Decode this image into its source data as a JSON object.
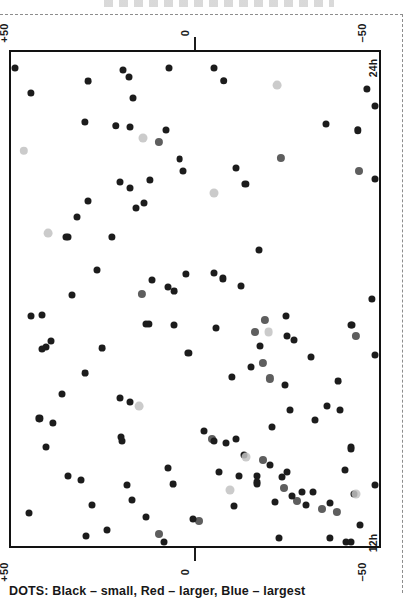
{
  "figure": {
    "caption": "DOTS: Black – small, Red – larger, Blue – largest",
    "axis_labels": {
      "top_left": "+50",
      "top_zero": "0",
      "top_right": "–50",
      "bottom_left": "+50",
      "bottom_zero": "0",
      "bottom_right": "–50",
      "right_upper": "24h",
      "right_lower": "12h"
    }
  },
  "chart_data": {
    "type": "scatter",
    "title": "",
    "subtitle": "",
    "caption": "DOTS: Black – small, Red – larger, Blue – largest",
    "xlabel": "",
    "ylabel": "",
    "xlim": [
      50,
      -50
    ],
    "ylim": [
      12,
      24
    ],
    "xticks": [
      50,
      0,
      -50
    ],
    "xticklabels": [
      "+50",
      "0",
      "–50"
    ],
    "yticks": [
      24,
      12
    ],
    "yticklabels": [
      "24h",
      "12h"
    ],
    "grid": false,
    "legend_position": "below-axes",
    "legend": [
      {
        "name": "Black",
        "size": "small",
        "color": "#1c1c1c",
        "radius_px": 3.6
      },
      {
        "name": "Red",
        "size": "larger",
        "color": "#5a5a5a",
        "radius_px": 4.2
      },
      {
        "name": "Blue",
        "size": "largest",
        "color": "#b9b9b9",
        "radius_px": 4.6
      }
    ],
    "note": "Scanned monochrome reproduction: colour classes appear as differing grey levels.",
    "point_count": 150,
    "points": [
      {
        "x": 44.5,
        "y": 23.0,
        "c": "black",
        "r": 3.6
      },
      {
        "x": 29.1,
        "y": 23.3,
        "c": "black",
        "r": 3.4
      },
      {
        "x": 17.9,
        "y": 23.4,
        "c": "black",
        "r": 3.5
      },
      {
        "x": -7.8,
        "y": 23.3,
        "c": "black",
        "r": 3.8
      },
      {
        "x": -22.3,
        "y": 23.2,
        "c": "blue",
        "r": 4.4
      },
      {
        "x": -46.7,
        "y": 23.1,
        "c": "black",
        "r": 3.6
      },
      {
        "x": 29.9,
        "y": 22.3,
        "c": "black",
        "r": 3.6
      },
      {
        "x": 21.5,
        "y": 22.2,
        "c": "black",
        "r": 3.7
      },
      {
        "x": 8.0,
        "y": 22.1,
        "c": "black",
        "r": 3.5
      },
      {
        "x": -44.2,
        "y": 22.1,
        "c": "black",
        "r": 3.7
      },
      {
        "x": 46.5,
        "y": 21.6,
        "c": "blue",
        "r": 4.2
      },
      {
        "x": 4.2,
        "y": 21.4,
        "c": "black",
        "r": 3.4
      },
      {
        "x": 3.2,
        "y": 21.1,
        "c": "black",
        "r": 3.5
      },
      {
        "x": -44.5,
        "y": 21.1,
        "c": "red",
        "r": 4.0
      },
      {
        "x": 12.2,
        "y": 20.9,
        "c": "black",
        "r": 3.6
      },
      {
        "x": -13.7,
        "y": 20.8,
        "c": "black",
        "r": 3.6
      },
      {
        "x": 16.0,
        "y": 20.2,
        "c": "black",
        "r": 3.5
      },
      {
        "x": 40.0,
        "y": 19.6,
        "c": "blue",
        "r": 4.4
      },
      {
        "x": 22.5,
        "y": 19.5,
        "c": "black",
        "r": 3.6
      },
      {
        "x": -17.5,
        "y": 19.2,
        "c": "black",
        "r": 3.5
      },
      {
        "x": 26.6,
        "y": 18.7,
        "c": "black",
        "r": 3.5
      },
      {
        "x": 2.5,
        "y": 18.6,
        "c": "black",
        "r": 3.6
      },
      {
        "x": -7.6,
        "y": 18.5,
        "c": "black",
        "r": 3.6
      },
      {
        "x": 33.5,
        "y": 18.1,
        "c": "black",
        "r": 3.5
      },
      {
        "x": 7.3,
        "y": 18.3,
        "c": "black",
        "r": 3.5
      },
      {
        "x": 5.7,
        "y": 18.2,
        "c": "black",
        "r": 3.4
      },
      {
        "x": -48.0,
        "y": 18.0,
        "c": "black",
        "r": 3.6
      },
      {
        "x": 41.5,
        "y": 17.6,
        "c": "black",
        "r": 3.5
      },
      {
        "x": 12.5,
        "y": 17.4,
        "c": "black",
        "r": 3.6
      },
      {
        "x": -5.6,
        "y": 17.3,
        "c": "black",
        "r": 3.5
      },
      {
        "x": -16.4,
        "y": 17.2,
        "c": "red",
        "r": 4.0
      },
      {
        "x": -20.0,
        "y": 17.2,
        "c": "blue",
        "r": 4.4
      },
      {
        "x": -25.0,
        "y": 17.1,
        "c": "black",
        "r": 3.5
      },
      {
        "x": -27.0,
        "y": 17.0,
        "c": "black",
        "r": 3.5
      },
      {
        "x": 25.3,
        "y": 16.8,
        "c": "black",
        "r": 3.4
      },
      {
        "x": 1.8,
        "y": 16.7,
        "c": "black",
        "r": 3.6
      },
      {
        "x": -31.4,
        "y": 16.6,
        "c": "black",
        "r": 3.5
      },
      {
        "x": 29.8,
        "y": 16.2,
        "c": "black",
        "r": 3.4
      },
      {
        "x": -10.0,
        "y": 16.1,
        "c": "black",
        "r": 3.6
      },
      {
        "x": -38.9,
        "y": 16.0,
        "c": "black",
        "r": 3.4
      },
      {
        "x": 36.2,
        "y": 15.7,
        "c": "black",
        "r": 3.5
      },
      {
        "x": 20.4,
        "y": 15.6,
        "c": "black",
        "r": 3.5
      },
      {
        "x": 17.8,
        "y": 15.5,
        "c": "black",
        "r": 3.5
      },
      {
        "x": 15.1,
        "y": 15.4,
        "c": "blue",
        "r": 4.4
      },
      {
        "x": -36.0,
        "y": 15.4,
        "c": "black",
        "r": 3.5
      },
      {
        "x": -39.5,
        "y": 15.3,
        "c": "black",
        "r": 3.5
      },
      {
        "x": 42.3,
        "y": 15.1,
        "c": "black",
        "r": 3.6
      },
      {
        "x": 38.6,
        "y": 15.0,
        "c": "black",
        "r": 3.6
      },
      {
        "x": -21.0,
        "y": 14.9,
        "c": "black",
        "r": 3.5
      },
      {
        "x": -2.5,
        "y": 14.8,
        "c": "black",
        "r": 3.5
      },
      {
        "x": -4.5,
        "y": 14.6,
        "c": "red",
        "r": 4.0
      },
      {
        "x": -8.4,
        "y": 14.5,
        "c": "black",
        "r": 3.5
      },
      {
        "x": -42.4,
        "y": 14.4,
        "c": "black",
        "r": 3.5
      },
      {
        "x": -13.3,
        "y": 14.2,
        "c": "black",
        "r": 3.5
      },
      {
        "x": -18.5,
        "y": 14.1,
        "c": "red",
        "r": 4.0
      },
      {
        "x": -6.5,
        "y": 13.8,
        "c": "black",
        "r": 3.5
      },
      {
        "x": -12.0,
        "y": 13.7,
        "c": "black",
        "r": 3.5
      },
      {
        "x": 31.0,
        "y": 13.6,
        "c": "black",
        "r": 3.5
      },
      {
        "x": 6.0,
        "y": 13.5,
        "c": "black",
        "r": 3.4
      },
      {
        "x": -16.8,
        "y": 13.5,
        "c": "black",
        "r": 3.5
      },
      {
        "x": -24.2,
        "y": 13.4,
        "c": "red",
        "r": 4.0
      },
      {
        "x": -29.0,
        "y": 13.3,
        "c": "black",
        "r": 3.5
      },
      {
        "x": -32.1,
        "y": 13.3,
        "c": "black",
        "r": 3.5
      },
      {
        "x": -27.6,
        "y": 13.1,
        "c": "red",
        "r": 4.0
      },
      {
        "x": -30.2,
        "y": 13.0,
        "c": "black",
        "r": 3.5
      },
      {
        "x": -34.6,
        "y": 12.9,
        "c": "red",
        "r": 4.0
      },
      {
        "x": 45.0,
        "y": 12.8,
        "c": "black",
        "r": 3.5
      },
      {
        "x": 13.4,
        "y": 12.7,
        "c": "black",
        "r": 3.5
      },
      {
        "x": -1.2,
        "y": 12.6,
        "c": "red",
        "r": 4.0
      },
      {
        "x": -44.8,
        "y": 12.5,
        "c": "black",
        "r": 3.5
      },
      {
        "x": 24.0,
        "y": 12.4,
        "c": "black",
        "r": 3.5
      },
      {
        "x": 9.8,
        "y": 12.3,
        "c": "red",
        "r": 4.0
      },
      {
        "x": -22.7,
        "y": 12.2,
        "c": "black",
        "r": 3.5
      },
      {
        "x": -36.7,
        "y": 12.2,
        "c": "black",
        "r": 3.6
      },
      {
        "x": -40.9,
        "y": 12.1,
        "c": "black",
        "r": 3.5
      }
    ]
  }
}
